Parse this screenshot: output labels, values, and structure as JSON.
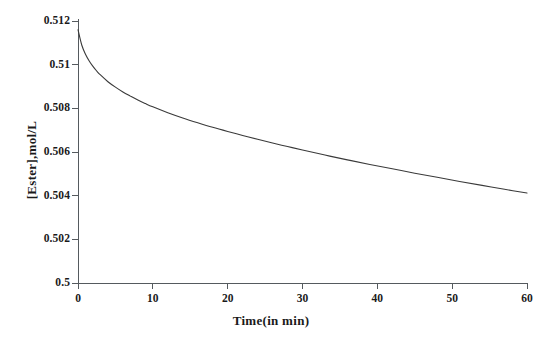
{
  "chart_data": {
    "type": "line",
    "title": "",
    "xlabel": "Time(in min)",
    "ylabel": "[Ester],mol/L",
    "xlim": [
      0,
      60
    ],
    "ylim": [
      0.5,
      0.512
    ],
    "xticks": [
      0,
      10,
      20,
      30,
      40,
      50,
      60
    ],
    "xtick_labels": [
      "0",
      "10",
      "20",
      "30",
      "40",
      "50",
      "60"
    ],
    "yticks": [
      0.5,
      0.502,
      0.504,
      0.506,
      0.508,
      0.51,
      0.512
    ],
    "ytick_labels": [
      "0.5",
      "0.502",
      "0.504",
      "0.506",
      "0.508",
      "0.51",
      "0.512"
    ],
    "grid": false,
    "legend": null,
    "line_color": "#3a3a3a",
    "line_width": 1.1,
    "series": [
      {
        "name": "[Ester]",
        "x": [
          0,
          0.5,
          1,
          1.5,
          2,
          2.5,
          3,
          4,
          5,
          6,
          7,
          8,
          9,
          10,
          12,
          14,
          16,
          18,
          20,
          22,
          24,
          26,
          28,
          30,
          33,
          36,
          39,
          42,
          45,
          48,
          51,
          54,
          57,
          60
        ],
        "y": [
          0.5116,
          0.5109,
          0.51048,
          0.51017,
          0.50992,
          0.50971,
          0.50953,
          0.50922,
          0.50897,
          0.50875,
          0.50856,
          0.50838,
          0.50822,
          0.50807,
          0.5078,
          0.50756,
          0.50734,
          0.50713,
          0.50694,
          0.50676,
          0.50658,
          0.50641,
          0.50625,
          0.50609,
          0.50586,
          0.50564,
          0.50543,
          0.50523,
          0.50503,
          0.50484,
          0.50465,
          0.50447,
          0.50429,
          0.50412
        ]
      }
    ]
  }
}
